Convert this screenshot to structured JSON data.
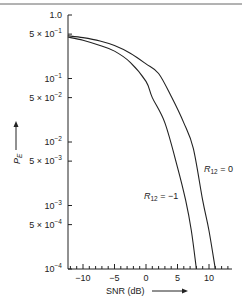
{
  "chart_data": {
    "type": "line",
    "title": "",
    "xlabel": "SNR (dB)",
    "ylabel": "P_E",
    "x_scale": "linear",
    "y_scale": "log",
    "xlim": [
      -12.4,
      13.7
    ],
    "ylim": [
      0.0001,
      1.0
    ],
    "grid": false,
    "x_ticks": [
      -10,
      -5,
      0,
      5,
      10
    ],
    "x_tick_labels": [
      "−10",
      "−5",
      "0",
      "5",
      "10"
    ],
    "y_ticks": [
      1.0,
      0.5,
      0.1,
      0.05,
      0.01,
      0.005,
      0.001,
      0.0005,
      0.0001
    ],
    "y_tick_labels": [
      {
        "base": "1.0",
        "exp": ""
      },
      {
        "base": "5 × 10",
        "exp": "−1"
      },
      {
        "base": "10",
        "exp": "−1"
      },
      {
        "base": "5 × 10",
        "exp": "−2"
      },
      {
        "base": "10",
        "exp": "−2"
      },
      {
        "base": "5 × 10",
        "exp": "−3"
      },
      {
        "base": "10",
        "exp": "−3"
      },
      {
        "base": "5 × 10",
        "exp": "−4"
      },
      {
        "base": "10",
        "exp": "−4"
      }
    ],
    "series": [
      {
        "name": "R12 = 0",
        "label_main": "R",
        "label_sub": "12",
        "label_rest": " = 0",
        "points": [
          [
            -12.4,
            0.47
          ],
          [
            -10,
            0.44
          ],
          [
            -7.3,
            0.39
          ],
          [
            -5,
            0.33
          ],
          [
            -2.5,
            0.25
          ],
          [
            0,
            0.17
          ],
          [
            2,
            0.12
          ],
          [
            4.1,
            0.05
          ],
          [
            6,
            0.02
          ],
          [
            7.5,
            0.008
          ],
          [
            9,
            0.0012
          ],
          [
            10,
            0.0004
          ],
          [
            11,
            0.0001
          ]
        ]
      },
      {
        "name": "R12 = −1",
        "label_main": "R",
        "label_sub": "12",
        "label_rest": " = −1",
        "points": [
          [
            -12.4,
            0.45
          ],
          [
            -10,
            0.4
          ],
          [
            -7.3,
            0.33
          ],
          [
            -5,
            0.27
          ],
          [
            -2.5,
            0.18
          ],
          [
            0,
            0.09
          ],
          [
            1,
            0.05
          ],
          [
            3,
            0.02
          ],
          [
            5,
            0.004
          ],
          [
            6.3,
            0.0012
          ],
          [
            7.2,
            0.0004
          ],
          [
            8,
            0.0001
          ]
        ]
      }
    ],
    "legend": "inline labels",
    "annotations": [
      "R12 = 0",
      "R12 = −1"
    ]
  }
}
